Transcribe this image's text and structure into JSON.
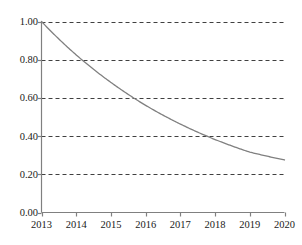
{
  "chart_data": {
    "type": "line",
    "title": "",
    "subtitle": "",
    "xlabel": "",
    "ylabel": "",
    "x": [
      2013,
      2014,
      2015,
      2016,
      2017,
      2018,
      2019,
      2020
    ],
    "series": [
      {
        "name": "decay",
        "values": [
          1.0,
          0.825,
          0.681,
          0.561,
          0.463,
          0.382,
          0.316,
          0.275
        ]
      }
    ],
    "x_tick_labels": [
      "2013",
      "2014",
      "2015",
      "2016",
      "2017",
      "2018",
      "2019",
      "2020"
    ],
    "y_tick_labels": [
      "0.00",
      "0.20",
      "0.40",
      "0.60",
      "0.80",
      "1.00"
    ],
    "y_tick_values": [
      0.0,
      0.2,
      0.4,
      0.6,
      0.8,
      1.0
    ],
    "xlim": [
      2013,
      2020
    ],
    "ylim": [
      0.0,
      1.0
    ],
    "grid": "horizontal-dashed",
    "legend": "none",
    "annotations": [],
    "line_color": "#808080",
    "grid_color": "#404040",
    "axis_color": "#808080"
  },
  "axes": {
    "y_ticks": [
      {
        "label": "1.00",
        "value": 1.0
      },
      {
        "label": "0.80",
        "value": 0.8
      },
      {
        "label": "0.60",
        "value": 0.6
      },
      {
        "label": "0.40",
        "value": 0.4
      },
      {
        "label": "0.20",
        "value": 0.2
      },
      {
        "label": "0.00",
        "value": 0.0
      }
    ],
    "x_ticks": [
      {
        "label": "2013",
        "value": 2013
      },
      {
        "label": "2014",
        "value": 2014
      },
      {
        "label": "2015",
        "value": 2015
      },
      {
        "label": "2016",
        "value": 2016
      },
      {
        "label": "2017",
        "value": 2017
      },
      {
        "label": "2018",
        "value": 2018
      },
      {
        "label": "2019",
        "value": 2019
      },
      {
        "label": "2020",
        "value": 2020
      }
    ]
  }
}
